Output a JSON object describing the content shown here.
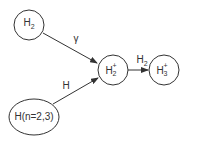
{
  "diagram": {
    "nodes": [
      {
        "id": "h2",
        "base": "H",
        "sub": "2",
        "sup": "",
        "label": "H2"
      },
      {
        "id": "h2plus",
        "base": "H",
        "sub": "2",
        "sup": "+",
        "label": "H2+"
      },
      {
        "id": "h3plus",
        "base": "H",
        "sub": "3",
        "sup": "+",
        "label": "H3+"
      },
      {
        "id": "h_excited",
        "label": "H(n=2,3)"
      }
    ],
    "edges": [
      {
        "from": "h2",
        "to": "h2plus",
        "label": "γ"
      },
      {
        "from": "h_excited",
        "to": "h2plus",
        "label": "H"
      },
      {
        "from": "h2plus",
        "to": "h3plus",
        "label_base": "H",
        "label_sub": "2",
        "label": "H2"
      }
    ],
    "colors": {
      "stroke": "#333333",
      "background": "#ffffff"
    }
  }
}
